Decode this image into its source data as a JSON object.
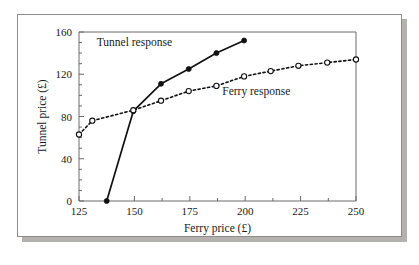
{
  "chart_data": {
    "type": "line",
    "title": "",
    "xlabel": "Ferry price (£)",
    "ylabel": "Tunnel price (£)",
    "xlim": [
      125,
      250
    ],
    "ylim": [
      0,
      160
    ],
    "xticks": [
      125,
      150,
      175,
      200,
      225,
      250
    ],
    "yticks": [
      0,
      40,
      80,
      120,
      160
    ],
    "xtick_labels": [
      "125",
      "150",
      "175",
      "200",
      "225",
      "250"
    ],
    "ytick_labels": [
      "0",
      "40",
      "80",
      "120",
      "160"
    ],
    "x_minor_tick_count": 1,
    "y_minor_tick_count": 3,
    "grid": false,
    "legend_position": "inline-annotation",
    "series": [
      {
        "name": "Tunnel response",
        "style": "solid",
        "marker": "filled-circle",
        "color": "#111111",
        "annotation": "Tunnel response",
        "points": [
          {
            "x": 137.5,
            "y": 0
          },
          {
            "x": 149.5,
            "y": 85
          },
          {
            "x": 162,
            "y": 111
          },
          {
            "x": 174.5,
            "y": 125
          },
          {
            "x": 187,
            "y": 140
          },
          {
            "x": 199.5,
            "y": 152
          }
        ]
      },
      {
        "name": "Ferry response",
        "style": "dashed",
        "marker": "open-circle",
        "color": "#111111",
        "annotation": "Ferry response",
        "points": [
          {
            "x": 125,
            "y": 63
          },
          {
            "x": 131,
            "y": 76
          },
          {
            "x": 149.5,
            "y": 86
          },
          {
            "x": 162,
            "y": 95
          },
          {
            "x": 174.5,
            "y": 104
          },
          {
            "x": 187,
            "y": 109
          },
          {
            "x": 199.5,
            "y": 118
          },
          {
            "x": 211.5,
            "y": 123
          },
          {
            "x": 224,
            "y": 128
          },
          {
            "x": 237,
            "y": 131
          },
          {
            "x": 250,
            "y": 134
          }
        ]
      }
    ],
    "annotations": [
      {
        "text": "Tunnel response",
        "x": 150,
        "y": 147
      },
      {
        "text": "Ferry response",
        "x": 205,
        "y": 100
      }
    ]
  }
}
